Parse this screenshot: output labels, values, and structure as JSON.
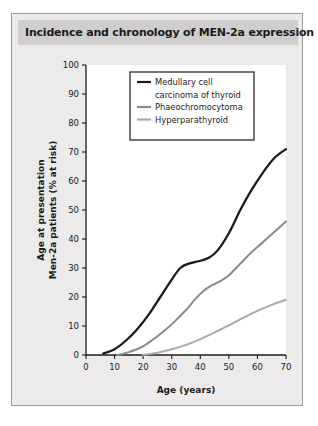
{
  "figure": {
    "title": "Incidence and chronology of MEN-2a expression"
  },
  "chart_data": {
    "type": "line",
    "title": "Incidence and chronology of MEN-2a expression",
    "xlabel": "Age (years)",
    "ylabel": "Age at presentation Men-2a patients (% at risk)",
    "ylabel_line1": "Age at presentation",
    "ylabel_line2": "Men-2a patients (% at risk)",
    "xlim": [
      0,
      70
    ],
    "ylim": [
      0,
      100
    ],
    "xticks": [
      0,
      10,
      20,
      30,
      40,
      50,
      60,
      70
    ],
    "yticks": [
      0,
      10,
      20,
      30,
      40,
      50,
      60,
      70,
      80,
      90,
      100
    ],
    "grid": false,
    "legend_position": "top-center",
    "series": [
      {
        "name": "Medullary cell carcinoma of thyroid",
        "legend_label_line1": "Medullary cell",
        "legend_label_line2": "carcinoma of thyroid",
        "color": "#1b1b1b",
        "width": 2.3,
        "x": [
          6,
          10,
          14,
          18,
          22,
          26,
          30,
          33,
          36,
          40,
          43,
          46,
          50,
          54,
          58,
          62,
          66,
          70
        ],
        "y": [
          0.5,
          2,
          5,
          9,
          14,
          20,
          26,
          30,
          31.5,
          32.5,
          33.5,
          36,
          42,
          50,
          57,
          63,
          68,
          71
        ]
      },
      {
        "name": "Phaeochromocytoma",
        "legend_label_line1": "Phaeochromocytoma",
        "color": "#8a8a8a",
        "width": 2.0,
        "x": [
          11,
          15,
          19,
          23,
          27,
          31,
          35,
          38,
          41,
          44,
          47,
          50,
          54,
          58,
          62,
          66,
          70
        ],
        "y": [
          0,
          1,
          2.5,
          5,
          8,
          11.5,
          15.5,
          19,
          22,
          24,
          25.5,
          27.5,
          31.5,
          35.5,
          39,
          42.5,
          46
        ]
      },
      {
        "name": "Hyperparathyroid",
        "legend_label_line1": "Hyperparathyroid",
        "color": "#aaaaaa",
        "width": 2.0,
        "x": [
          20,
          25,
          30,
          35,
          40,
          45,
          50,
          55,
          60,
          65,
          70
        ],
        "y": [
          0,
          0.8,
          2,
          3.5,
          5.5,
          7.8,
          10.2,
          12.8,
          15.2,
          17.3,
          19
        ]
      }
    ]
  }
}
